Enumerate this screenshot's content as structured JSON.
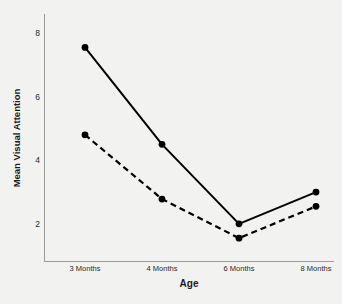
{
  "chart_data": {
    "type": "line",
    "title": "",
    "xlabel": "Age",
    "ylabel": "Mean Visual Attention",
    "categories": [
      "3 Months",
      "4 Months",
      "6 Months",
      "8 Months"
    ],
    "series": [
      {
        "name": "solid-series",
        "style": "solid",
        "color": "#000000",
        "marker": "filled-circle",
        "values": [
          7.55,
          4.5,
          2.0,
          3.0
        ]
      },
      {
        "name": "dashed-series",
        "style": "dashed",
        "color": "#000000",
        "marker": "filled-circle",
        "values": [
          4.8,
          2.78,
          1.55,
          2.55
        ]
      }
    ],
    "ylim": [
      0.8,
      8.6
    ],
    "y_ticks": [
      2,
      4,
      6,
      8
    ],
    "y_tick_labels": [
      "2",
      "4",
      "6",
      "8"
    ],
    "grid": false,
    "legend": "none",
    "background_color": "#f2f2f1",
    "axis_color": "#9a9a9a"
  },
  "axes": {
    "y_title": "Mean Visual Attention",
    "x_title": "Age",
    "y_tick_labels": [
      "8",
      "6",
      "4",
      "2"
    ],
    "x_tick_labels": [
      "3 Months",
      "4 Months",
      "6 Months",
      "8 Months"
    ]
  }
}
